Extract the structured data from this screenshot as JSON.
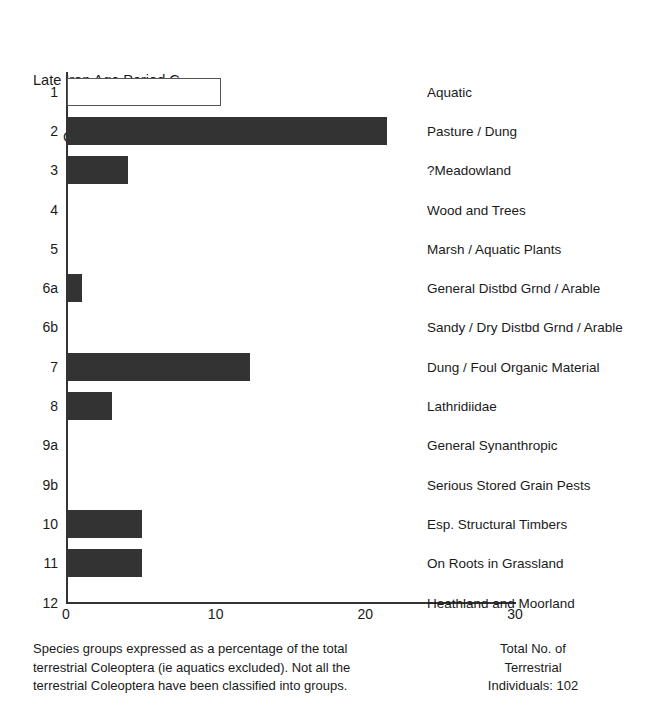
{
  "chart_data": {
    "type": "bar",
    "orientation": "horizontal",
    "title": "Late Iron Age Period C\nContext 706A",
    "title_line1": "Late Iron Age Period C",
    "title_line2": "Context 706A",
    "xlabel": "",
    "ylabel": "",
    "xlim": [
      0,
      30
    ],
    "xticks": [
      0,
      10,
      20,
      30
    ],
    "xtick_labels": [
      "0",
      "10",
      "20",
      "30"
    ],
    "grid": false,
    "legend": "none",
    "categories": [
      "1",
      "2",
      "3",
      "4",
      "5",
      "6a",
      "6b",
      "7",
      "8",
      "9a",
      "9b",
      "10",
      "11",
      "12"
    ],
    "category_names": [
      "Aquatic",
      "Pasture / Dung",
      "?Meadowland",
      "Wood and Trees",
      "Marsh / Aquatic Plants",
      "General Distbd Grnd / Arable",
      "Sandy / Dry Distbd Grnd / Arable",
      "Dung / Foul Organic Material",
      "Lathridiidae",
      "General Synanthropic",
      "Serious Stored Grain Pests",
      "Esp. Structural Timbers",
      "On Roots in Grassland",
      "Heathland and Moorland"
    ],
    "values": [
      10.3,
      21.4,
      4.1,
      0,
      0,
      1.0,
      0,
      12.2,
      3.0,
      0,
      0,
      5.0,
      5.0,
      0
    ],
    "bar_styles": [
      "hollow",
      "filled",
      "filled",
      "filled",
      "filled",
      "filled",
      "filled",
      "filled",
      "filled",
      "filled",
      "filled",
      "filled",
      "filled",
      "filled"
    ],
    "colors": {
      "bar_fill": "#333333",
      "bar_outline": "#555555",
      "axis": "#333333",
      "text": "#1a1a1a",
      "background": "#ffffff"
    }
  },
  "rows": [
    {
      "cat": "1",
      "label": "Aquatic",
      "value": 10.3,
      "style": "hollow"
    },
    {
      "cat": "2",
      "label": "Pasture / Dung",
      "value": 21.4,
      "style": "filled"
    },
    {
      "cat": "3",
      "label": "?Meadowland",
      "value": 4.1,
      "style": "filled"
    },
    {
      "cat": "4",
      "label": "Wood and Trees",
      "value": 0,
      "style": "filled"
    },
    {
      "cat": "5",
      "label": "Marsh / Aquatic Plants",
      "value": 0,
      "style": "filled"
    },
    {
      "cat": "6a",
      "label": "General Distbd Grnd / Arable",
      "value": 1.0,
      "style": "filled"
    },
    {
      "cat": "6b",
      "label": "Sandy / Dry Distbd Grnd / Arable",
      "value": 0,
      "style": "filled"
    },
    {
      "cat": "7",
      "label": "Dung / Foul Organic Material",
      "value": 12.2,
      "style": "filled"
    },
    {
      "cat": "8",
      "label": "Lathridiidae",
      "value": 3.0,
      "style": "filled"
    },
    {
      "cat": "9a",
      "label": "General Synanthropic",
      "value": 0,
      "style": "filled"
    },
    {
      "cat": "9b",
      "label": "Serious Stored Grain Pests",
      "value": 0,
      "style": "filled"
    },
    {
      "cat": "10",
      "label": "Esp. Structural Timbers",
      "value": 5.0,
      "style": "filled"
    },
    {
      "cat": "11",
      "label": "On Roots in Grassland",
      "value": 5.0,
      "style": "filled"
    },
    {
      "cat": "12",
      "label": "Heathland and Moorland",
      "value": 0,
      "style": "filled"
    }
  ],
  "caption_left": {
    "line1": "Species groups expressed as a percentage of the total",
    "line2": "terrestrial Coleoptera (ie aquatics excluded). Not all the",
    "line3": "terrestrial Coleoptera have been classified into groups."
  },
  "caption_right": {
    "line1": "Total No. of",
    "line2": "Terrestrial",
    "line3": "Individuals: 102"
  }
}
